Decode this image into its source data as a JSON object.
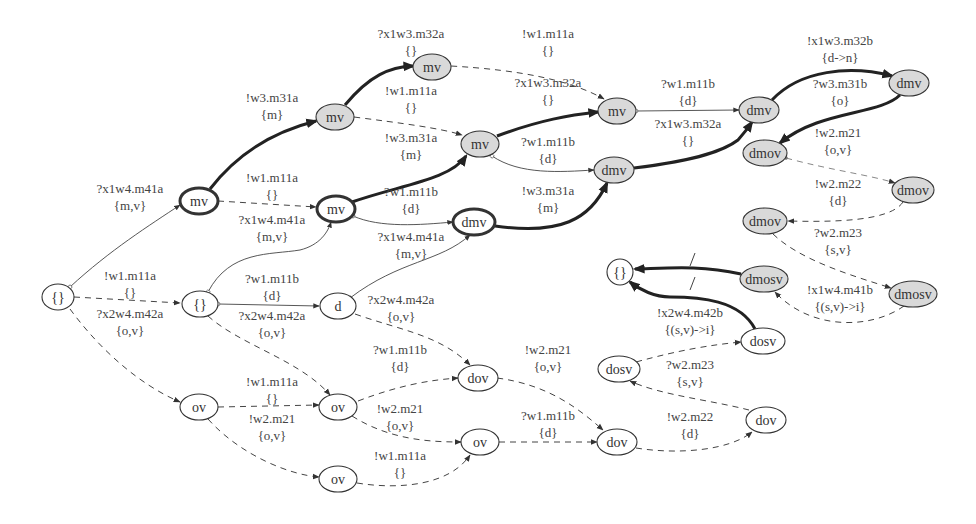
{
  "diagram": {
    "nodes": [
      {
        "id": "n0",
        "label": "{}",
        "x": 58,
        "y": 297,
        "rx": 16,
        "ry": 13,
        "style": "plain"
      },
      {
        "id": "n1",
        "label": "mv",
        "x": 199,
        "y": 201,
        "rx": 19,
        "ry": 13,
        "style": "thick"
      },
      {
        "id": "n2",
        "label": "{}",
        "x": 200,
        "y": 304,
        "rx": 18,
        "ry": 13,
        "style": "plain"
      },
      {
        "id": "n3",
        "label": "ov",
        "x": 199,
        "y": 407,
        "rx": 19,
        "ry": 13,
        "style": "plain"
      },
      {
        "id": "n4",
        "label": "mv",
        "x": 432,
        "y": 67,
        "rx": 19,
        "ry": 13,
        "style": "gray"
      },
      {
        "id": "n5",
        "label": "mv",
        "x": 335,
        "y": 117,
        "rx": 19,
        "ry": 13,
        "style": "gray"
      },
      {
        "id": "n6",
        "label": "mv",
        "x": 480,
        "y": 144,
        "rx": 19,
        "ry": 13,
        "style": "gray"
      },
      {
        "id": "n7",
        "label": "mv",
        "x": 617,
        "y": 111,
        "rx": 19,
        "ry": 13,
        "style": "gray"
      },
      {
        "id": "n8",
        "label": "mv",
        "x": 336,
        "y": 209,
        "rx": 19,
        "ry": 13,
        "style": "thick"
      },
      {
        "id": "n9",
        "label": "dmv",
        "x": 474,
        "y": 222,
        "rx": 21,
        "ry": 13,
        "style": "thick"
      },
      {
        "id": "n10",
        "label": "dmv",
        "x": 614,
        "y": 170,
        "rx": 20,
        "ry": 13,
        "style": "gray"
      },
      {
        "id": "n11",
        "label": "d",
        "x": 338,
        "y": 306,
        "rx": 18,
        "ry": 13,
        "style": "plain"
      },
      {
        "id": "n12",
        "label": "dmv",
        "x": 759,
        "y": 110,
        "rx": 20,
        "ry": 13,
        "style": "gray"
      },
      {
        "id": "n13",
        "label": "dmv",
        "x": 909,
        "y": 83,
        "rx": 20,
        "ry": 13,
        "style": "gray"
      },
      {
        "id": "n14",
        "label": "dmov",
        "x": 765,
        "y": 153,
        "rx": 22,
        "ry": 13,
        "style": "gray"
      },
      {
        "id": "n15",
        "label": "dmov",
        "x": 913,
        "y": 190,
        "rx": 21,
        "ry": 13,
        "style": "gray"
      },
      {
        "id": "n16",
        "label": "dmov",
        "x": 765,
        "y": 221,
        "rx": 22,
        "ry": 13,
        "style": "gray"
      },
      {
        "id": "n17",
        "label": "dmosv",
        "x": 764,
        "y": 279,
        "rx": 24,
        "ry": 13,
        "style": "gray"
      },
      {
        "id": "n18",
        "label": "dmosv",
        "x": 913,
        "y": 294,
        "rx": 24,
        "ry": 13,
        "style": "gray"
      },
      {
        "id": "n19",
        "label": "{}",
        "x": 620,
        "y": 272,
        "rx": 13,
        "ry": 13,
        "style": "plain"
      },
      {
        "id": "n20",
        "label": "dosv",
        "x": 763,
        "y": 341,
        "rx": 22,
        "ry": 13,
        "style": "plain"
      },
      {
        "id": "n21",
        "label": "dosv",
        "x": 619,
        "y": 369,
        "rx": 21,
        "ry": 13,
        "style": "plain"
      },
      {
        "id": "n22",
        "label": "dov",
        "x": 478,
        "y": 378,
        "rx": 20,
        "ry": 13,
        "style": "plain"
      },
      {
        "id": "n23",
        "label": "ov",
        "x": 338,
        "y": 407,
        "rx": 19,
        "ry": 13,
        "style": "plain"
      },
      {
        "id": "n24",
        "label": "ov",
        "x": 480,
        "y": 442,
        "rx": 19,
        "ry": 13,
        "style": "plain"
      },
      {
        "id": "n25",
        "label": "dov",
        "x": 617,
        "y": 442,
        "rx": 20,
        "ry": 13,
        "style": "plain"
      },
      {
        "id": "n26",
        "label": "dov",
        "x": 766,
        "y": 420,
        "rx": 20,
        "ry": 13,
        "style": "plain"
      },
      {
        "id": "n27",
        "label": "ov",
        "x": 338,
        "y": 479,
        "rx": 19,
        "ry": 13,
        "style": "plain"
      }
    ],
    "edges": [
      {
        "id": "e1",
        "path": "M 70 287 C 110 250 150 225 180 205",
        "style": "thin",
        "start": "circle",
        "label": [
          "?x1w4.m41a",
          "{m,v}"
        ],
        "lx": 130,
        "ly": 193
      },
      {
        "id": "e2",
        "path": "M 74 297 L 180 303",
        "style": "dashed",
        "label": [
          "!w1.m11a",
          "{}"
        ],
        "lx": 130,
        "ly": 280
      },
      {
        "id": "e3",
        "path": "M 70 309 C 100 350 140 385 180 402",
        "style": "dashed",
        "label": [
          "?x2w4.m42a",
          "{o,v}"
        ],
        "lx": 130,
        "ly": 318
      },
      {
        "id": "e4",
        "path": "M 210 189 C 240 150 280 130 316 121",
        "style": "thick",
        "label": [
          "!w3.m31a",
          "{m}"
        ],
        "lx": 272,
        "ly": 102
      },
      {
        "id": "e5",
        "path": "M 218 201 L 316 207",
        "style": "dashed",
        "label": [
          "!w1.m11a",
          "{}"
        ],
        "lx": 272,
        "ly": 182
      },
      {
        "id": "e6",
        "path": "M 208 292 C 230 250 270 255 300 250 C 320 245 328 232 331 222",
        "style": "thin",
        "start": "circle",
        "label": [
          "?x1w4.m41a",
          "{m,v}"
        ],
        "lx": 272,
        "ly": 224
      },
      {
        "id": "e7",
        "path": "M 218 304 L 319 306",
        "style": "thin",
        "start": "circle",
        "label": [
          "?w1.m11b",
          "{d}"
        ],
        "lx": 272,
        "ly": 283
      },
      {
        "id": "e8",
        "path": "M 208 316 C 240 345 300 360 330 395",
        "style": "dashed",
        "label": [
          "?x2w4.m42a",
          "{o,v}"
        ],
        "lx": 272,
        "ly": 320
      },
      {
        "id": "e9",
        "path": "M 218 407 L 319 405",
        "style": "dashed",
        "label": [
          "!w1.m11a",
          "{}"
        ],
        "lx": 272,
        "ly": 386
      },
      {
        "id": "e10",
        "path": "M 208 419 C 240 455 290 475 319 477",
        "style": "dashed",
        "label": [
          "!w2.m21",
          "{o,v}"
        ],
        "lx": 272,
        "ly": 423
      },
      {
        "id": "e11",
        "path": "M 345 105 C 370 75 390 67 413 66",
        "style": "thick",
        "label": [
          "?x1w3.m32a",
          "{}"
        ],
        "lx": 411,
        "ly": 38
      },
      {
        "id": "e12",
        "path": "M 354 117 C 400 123 440 128 462 135",
        "style": "dashed",
        "label": [
          "!w1.m11a",
          "{}"
        ],
        "lx": 411,
        "ly": 95
      },
      {
        "id": "e13",
        "path": "M 352 202 C 400 185 450 180 466 156",
        "style": "thick",
        "label": [
          "!w3.m31a",
          "{m}"
        ],
        "lx": 411,
        "ly": 142
      },
      {
        "id": "e14",
        "path": "M 353 216 C 380 228 420 225 453 222",
        "style": "thin",
        "start": "circle",
        "label": [
          "?w1.m11b",
          "{d}"
        ],
        "lx": 411,
        "ly": 196
      },
      {
        "id": "e15",
        "path": "M 350 298 C 400 260 440 262 470 235",
        "style": "thin",
        "start": "circle",
        "label": [
          "?x1w4.m41a",
          "{m,v}"
        ],
        "lx": 411,
        "ly": 241
      },
      {
        "id": "e16",
        "path": "M 355 314 C 400 330 440 335 470 365",
        "style": "dashed",
        "label": [
          "?x2w4.m42a",
          "{o,v}"
        ],
        "lx": 401,
        "ly": 304
      },
      {
        "id": "e17",
        "path": "M 358 401 C 400 385 430 380 458 378",
        "style": "dashed",
        "label": [
          "?w1.m11b",
          "{d}"
        ],
        "lx": 400,
        "ly": 354
      },
      {
        "id": "e18",
        "path": "M 352 416 C 390 440 430 442 461 442",
        "style": "dashed",
        "label": [
          "!w2.m21",
          "{o,v}"
        ],
        "lx": 400,
        "ly": 413
      },
      {
        "id": "e19",
        "path": "M 357 483 C 400 490 450 485 470 455",
        "style": "dashed",
        "label": [
          "!w1.m11a",
          "{}"
        ],
        "lx": 400,
        "ly": 460
      },
      {
        "id": "e20",
        "path": "M 451 66 C 520 70 570 80 604 99",
        "style": "dashed",
        "label": [
          "!w1.m11a",
          "{}"
        ],
        "lx": 548,
        "ly": 38
      },
      {
        "id": "e21",
        "path": "M 497 136 C 540 120 570 115 598 112",
        "style": "thick",
        "label": [
          "?x1w3.m32a",
          "{}"
        ],
        "lx": 548,
        "ly": 87
      },
      {
        "id": "e22",
        "path": "M 492 156 C 520 175 560 172 594 170",
        "style": "thin",
        "start": "circle",
        "label": [
          "?w1.m11b",
          "{d}"
        ],
        "lx": 548,
        "ly": 146
      },
      {
        "id": "e23",
        "path": "M 495 226 C 560 235 590 220 607 183",
        "style": "thick",
        "label": [
          "!w3.m31a",
          "{m}"
        ],
        "lx": 548,
        "ly": 195
      },
      {
        "id": "e24",
        "path": "M 497 378 C 550 385 580 410 603 430",
        "style": "dashed",
        "label": [
          "!w2.m21",
          "{o,v}"
        ],
        "lx": 548,
        "ly": 354
      },
      {
        "id": "e25",
        "path": "M 499 442 L 597 442",
        "style": "dashed",
        "label": [
          "?w1.m11b",
          "{d}"
        ],
        "lx": 548,
        "ly": 420
      },
      {
        "id": "e26",
        "path": "M 636 111 L 739 110",
        "style": "thin",
        "start": "circle",
        "label": [
          "?w1.m11b",
          "{d}"
        ],
        "lx": 688,
        "ly": 88
      },
      {
        "id": "e27",
        "path": "M 634 168 C 700 160 725 150 738 140 C 745 132 750 125 752 122",
        "style": "thick",
        "label": [
          "?x1w3.m32a",
          "{}"
        ],
        "lx": 688,
        "ly": 128
      },
      {
        "id": "e28",
        "path": "M 772 100 C 800 70 850 65 892 76",
        "style": "thick",
        "label": [
          "!x1w3.m32b",
          "{d->n}"
        ],
        "lx": 840,
        "ly": 45
      },
      {
        "id": "e29",
        "path": "M 900 95 C 880 115 820 110 780 143",
        "style": "thick",
        "label": [
          "?w3.m31b",
          "{o}"
        ],
        "lx": 840,
        "ly": 88
      },
      {
        "id": "e30",
        "path": "M 786 158 C 830 170 870 175 895 183",
        "style": "dashed light",
        "start": "dot",
        "label": [
          "!w2.m21",
          "{o,v}"
        ],
        "lx": 838,
        "ly": 137
      },
      {
        "id": "e31",
        "path": "M 903 202 C 890 222 830 222 788 221",
        "style": "dashed",
        "label": [
          "!w2.m22",
          "{d}"
        ],
        "lx": 838,
        "ly": 188
      },
      {
        "id": "e32",
        "path": "M 773 234 C 800 260 850 275 891 288",
        "style": "dashed",
        "label": [
          "?w2.m23",
          "{s,v}"
        ],
        "lx": 838,
        "ly": 237
      },
      {
        "id": "e33",
        "path": "M 904 306 C 870 330 810 330 775 292",
        "style": "dashed",
        "label": [
          "!x1w4.m41b",
          "{(s,v)->i}"
        ],
        "lx": 840,
        "ly": 294
      },
      {
        "id": "e34",
        "path": "M 741 274 C 700 265 670 268 635 269",
        "style": "thick",
        "label": [
          "",
          ""
        ],
        "lx": 0,
        "ly": 0
      },
      {
        "id": "e35",
        "path": "M 755 329 C 740 300 700 297 670 297 C 655 297 640 290 630 282",
        "style": "thick",
        "label": [
          "!x2w4.m42b",
          "{(s,v)->i}"
        ],
        "lx": 690,
        "ly": 317
      },
      {
        "id": "e36",
        "path": "M 636 362 C 680 350 710 345 741 342",
        "style": "dashed",
        "label": [
          "",
          ""
        ],
        "lx": 0,
        "ly": 0
      },
      {
        "id": "e37",
        "path": "M 749 410 C 710 400 660 395 630 381",
        "style": "dashed",
        "label": [
          "?w2.m23",
          "{s,v}"
        ],
        "lx": 690,
        "ly": 369
      },
      {
        "id": "e38",
        "path": "M 636 448 C 680 455 730 450 752 432",
        "style": "dashed",
        "label": [
          "!w2.m22",
          "{d}"
        ],
        "lx": 690,
        "ly": 421
      }
    ],
    "ticks": [
      {
        "x1": 690,
        "y1": 266,
        "x2": 695,
        "y2": 253
      },
      {
        "x1": 690,
        "y1": 290,
        "x2": 695,
        "y2": 277
      }
    ]
  }
}
